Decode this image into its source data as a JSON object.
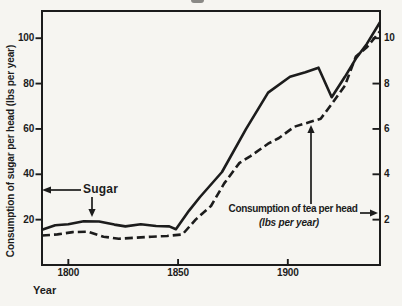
{
  "colors": {
    "ink": "#1c1c1c",
    "paper": "#f6f5f1"
  },
  "annotations": {
    "sugar_label": "Sugar",
    "tea_label_line1": "Consumption of tea per head",
    "tea_label_line2": "(lbs per year)",
    "x_axis_label": "Year",
    "y_axis_label": "Consumption of sugar per head (lbs per year)"
  },
  "chart_data": {
    "type": "line",
    "title": "",
    "grid": false,
    "legend_position": "annotated-arrows",
    "x_axis": {
      "label": "Year",
      "min": 1788,
      "max": 1942,
      "ticks": [
        1800,
        1850,
        1900
      ]
    },
    "y_axis_left": {
      "label": "Consumption of sugar per head (lbs per year)",
      "min": 0,
      "max": 112,
      "ticks": [
        20,
        40,
        60,
        80,
        100
      ]
    },
    "y_axis_right": {
      "label": "Consumption of tea per head (lbs per year)",
      "min": 0,
      "max": 11.2,
      "ticks": [
        2,
        4,
        6,
        8,
        10
      ]
    },
    "series": [
      {
        "name": "Sugar",
        "axis": "left",
        "style": "solid",
        "units": "lbs per year",
        "points": [
          [
            1788,
            15.5
          ],
          [
            1794,
            17.5
          ],
          [
            1800,
            18
          ],
          [
            1807,
            19.3
          ],
          [
            1814,
            19.2
          ],
          [
            1821,
            17.8
          ],
          [
            1826,
            17
          ],
          [
            1833,
            18
          ],
          [
            1840,
            17.2
          ],
          [
            1846,
            17
          ],
          [
            1849,
            15.8
          ],
          [
            1855,
            24
          ],
          [
            1860,
            30
          ],
          [
            1870,
            41
          ],
          [
            1881,
            60
          ],
          [
            1891,
            76
          ],
          [
            1901,
            83
          ],
          [
            1908,
            85
          ],
          [
            1914,
            87
          ],
          [
            1920,
            74
          ],
          [
            1926,
            83
          ],
          [
            1931,
            91
          ],
          [
            1936,
            97.5
          ],
          [
            1942,
            107
          ]
        ]
      },
      {
        "name": "Tea",
        "axis": "right",
        "style": "dashed",
        "units": "lbs per year",
        "points": [
          [
            1788,
            1.3
          ],
          [
            1795,
            1.35
          ],
          [
            1802,
            1.45
          ],
          [
            1809,
            1.47
          ],
          [
            1816,
            1.25
          ],
          [
            1823,
            1.16
          ],
          [
            1830,
            1.2
          ],
          [
            1838,
            1.25
          ],
          [
            1845,
            1.28
          ],
          [
            1852,
            1.35
          ],
          [
            1858,
            2.0
          ],
          [
            1865,
            2.6
          ],
          [
            1871,
            3.6
          ],
          [
            1878,
            4.5
          ],
          [
            1883,
            4.8
          ],
          [
            1891,
            5.35
          ],
          [
            1896,
            5.6
          ],
          [
            1903,
            6.1
          ],
          [
            1910,
            6.3
          ],
          [
            1915,
            6.45
          ],
          [
            1920,
            7.1
          ],
          [
            1926,
            7.9
          ],
          [
            1931,
            9.2
          ],
          [
            1936,
            9.6
          ],
          [
            1942,
            10.3
          ]
        ]
      }
    ]
  }
}
